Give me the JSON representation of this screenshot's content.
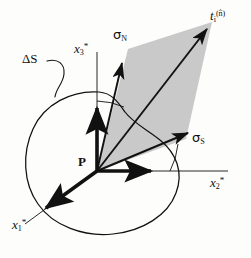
{
  "figure": {
    "background_color": "#fdfdfb",
    "stroke_color": "#111111",
    "plane_fill_color": "#c9c9c9"
  },
  "labels": {
    "traction": {
      "base": "t",
      "sub": "i",
      "sup": "(n̂)",
      "name": "traction-vector-label"
    },
    "sigma_normal": {
      "base": "σ",
      "sub": "N",
      "name": "sigma-normal-label"
    },
    "sigma_shear": {
      "base": "σ",
      "sub": "S",
      "name": "sigma-shear-label"
    },
    "axis_x1": {
      "base": "x",
      "sub": "1",
      "star": "*",
      "name": "axis-x1-label"
    },
    "axis_x2": {
      "base": "x",
      "sub": "2",
      "star": "*",
      "name": "axis-x2-label"
    },
    "axis_x3": {
      "base": "x",
      "sub": "3",
      "star": "*",
      "name": "axis-x3-label"
    },
    "delta_s": {
      "text": "ΔS",
      "name": "delta-s-label"
    },
    "point_p": {
      "text": "P",
      "name": "point-p-label"
    }
  },
  "geometry": {
    "origin": {
      "x": 97,
      "y": 171
    },
    "plane_corners": [
      {
        "x": 97,
        "y": 171
      },
      {
        "x": 128,
        "y": 49
      },
      {
        "x": 212,
        "y": 22
      },
      {
        "x": 186,
        "y": 139
      }
    ],
    "vectors": [
      {
        "name": "sigma-normal-arrow",
        "from": {
          "x": 97,
          "y": 171
        },
        "to": {
          "x": 123,
          "y": 58
        }
      },
      {
        "name": "sigma-shear-arrow",
        "from": {
          "x": 97,
          "y": 171
        },
        "to": {
          "x": 193,
          "y": 131
        }
      },
      {
        "name": "traction-arrow",
        "from": {
          "x": 97,
          "y": 171
        },
        "to": {
          "x": 210,
          "y": 25
        }
      },
      {
        "name": "axis-x3-arrow",
        "from": {
          "x": 97,
          "y": 171
        },
        "to": {
          "x": 97,
          "y": 104
        }
      },
      {
        "name": "axis-x2-arrow",
        "from": {
          "x": 97,
          "y": 171
        },
        "to": {
          "x": 156,
          "y": 171
        }
      },
      {
        "name": "axis-x1-arrow",
        "from": {
          "x": 97,
          "y": 171
        },
        "to": {
          "x": 42,
          "y": 211
        }
      }
    ],
    "axis_lines": [
      {
        "name": "axis-x3-line",
        "from": {
          "x": 97,
          "y": 171
        },
        "to": {
          "x": 97,
          "y": 52
        }
      },
      {
        "name": "axis-x2-line",
        "from": {
          "x": 97,
          "y": 171
        },
        "to": {
          "x": 228,
          "y": 171
        }
      },
      {
        "name": "axis-x1-line",
        "from": {
          "x": 97,
          "y": 171
        },
        "to": {
          "x": 25,
          "y": 224
        }
      }
    ]
  }
}
